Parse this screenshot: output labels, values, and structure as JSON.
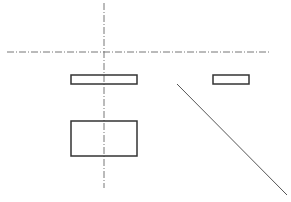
{
  "diagram": {
    "type": "orthographic-projection-drawing",
    "background": "#ffffff",
    "line_color": "#333333",
    "center_line_color": "#777777",
    "center_lines": [
      {
        "id": "horizontal-center-line",
        "x1": 7,
        "y1": 52,
        "x2": 270,
        "y2": 52,
        "style": "dash-dot"
      },
      {
        "id": "vertical-center-line",
        "x1": 104,
        "y1": 3,
        "x2": 104,
        "y2": 188,
        "style": "dash-dot"
      }
    ],
    "rectangles": [
      {
        "id": "front-view-top-rect",
        "x": 71,
        "y": 75,
        "width": 66,
        "height": 9
      },
      {
        "id": "side-view-rect",
        "x": 213,
        "y": 75,
        "width": 36,
        "height": 9
      },
      {
        "id": "top-view-rect",
        "x": 71,
        "y": 121,
        "width": 66,
        "height": 35
      }
    ],
    "miter_line": {
      "id": "miter-line",
      "x1": 177,
      "y1": 84,
      "x2": 287,
      "y2": 195
    }
  }
}
